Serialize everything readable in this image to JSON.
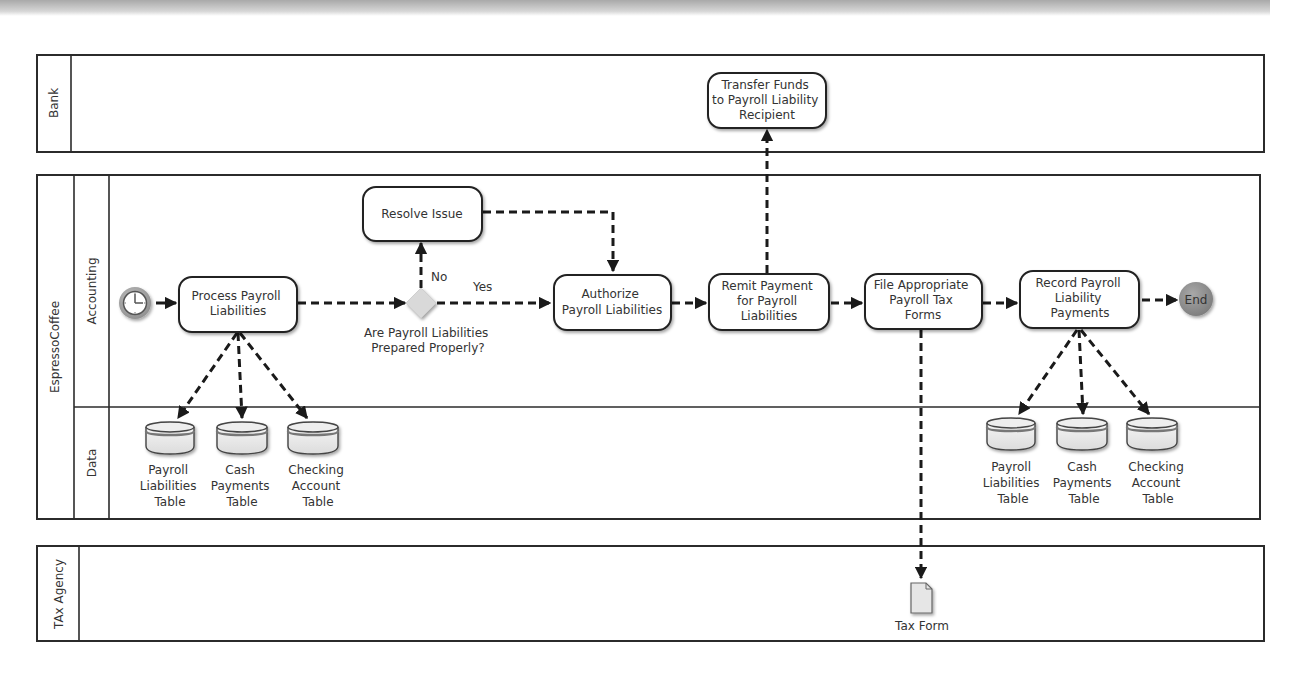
{
  "pools": {
    "bank": {
      "label": "Bank"
    },
    "company": {
      "label": "EspressoCoffee",
      "lanes": {
        "accounting": "Accounting",
        "data": "Data"
      }
    },
    "tax_agency": {
      "label": "TAx Agency"
    }
  },
  "tasks": {
    "transfer_funds": [
      "Transfer Funds",
      "to Payroll Liability",
      "Recipient"
    ],
    "resolve_issue": [
      "Resolve Issue"
    ],
    "process_payroll": [
      "Process Payroll",
      "Liabilities"
    ],
    "authorize": [
      "Authorize",
      "Payroll Liabilities"
    ],
    "remit_payment": [
      "Remit Payment",
      "for Payroll",
      "Liabilities"
    ],
    "file_forms": [
      "File Appropriate",
      "Payroll Tax",
      "Forms"
    ],
    "record_payments": [
      "Record Payroll",
      "Liability",
      "Payments"
    ]
  },
  "gateway": {
    "question": [
      "Are Payroll Liabilities",
      "Prepared Properly?"
    ],
    "yes_label": "Yes",
    "no_label": "No"
  },
  "events": {
    "start": {
      "icon": "clock-timer-icon"
    },
    "end": {
      "label": "End",
      "color": "#8a8a8a"
    }
  },
  "data_stores_left": [
    [
      "Payroll",
      "Liabilities",
      "Table"
    ],
    [
      "Cash",
      "Payments",
      "Table"
    ],
    [
      "Checking",
      "Account",
      "Table"
    ]
  ],
  "data_stores_right": [
    [
      "Payroll",
      "Liabilities",
      "Table"
    ],
    [
      "Cash",
      "Payments",
      "Table"
    ],
    [
      "Checking",
      "Account",
      "Table"
    ]
  ],
  "document": {
    "label": "Tax Form"
  },
  "colors": {
    "line": "#1a1a1a",
    "gateway": "#d9d9d9",
    "start_event": "#9a9a9a",
    "end_event": "#8a8a8a",
    "db_fill": "#e9e9e9",
    "db_band": "#7a7a7a"
  }
}
